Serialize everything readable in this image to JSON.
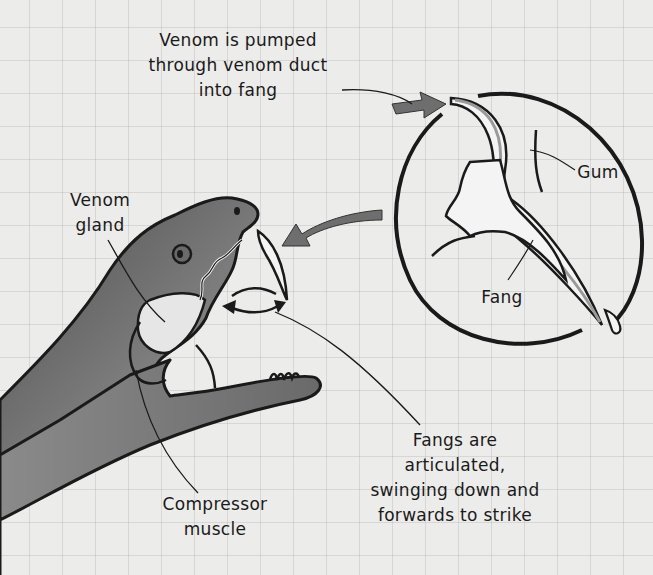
{
  "diagram": {
    "labels": {
      "venom_pumped": "Venom is pumped\nthrough venom duct\ninto fang",
      "venom_gland": "Venom\ngland",
      "gum": "Gum",
      "fang": "Fang",
      "compressor_muscle": "Compressor\nmuscle",
      "fangs_articulated": "Fangs are\narticulated,\nswinging down and\nforwards to strike"
    },
    "inset": {
      "type": "magnified-circle",
      "shows": [
        "venom duct",
        "fang",
        "gum",
        "venom droplet"
      ]
    },
    "colors": {
      "background": "#ececea",
      "grid": "#b8b8b8",
      "ink": "#1a1a1a",
      "snake_dark": "#5a5a5a",
      "snake_light": "#a8a8a8",
      "arrow_fill": "#6e6e6e",
      "gland_fill": "#e6e6e6"
    }
  }
}
